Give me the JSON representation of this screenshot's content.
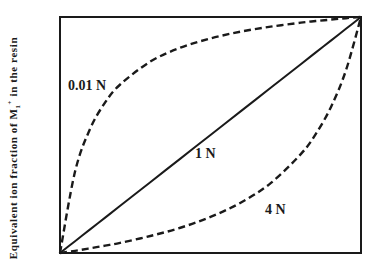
{
  "chart_data": {
    "type": "line",
    "title": "",
    "xlabel": "",
    "ylabel": "Equivalent ion fraction of M1+ in the resin",
    "ylabel_parts": {
      "prefix": "Equivalent ion fraction of M",
      "subscript": "1",
      "superscript": "+",
      "suffix": " in the resin"
    },
    "xlim": [
      0,
      1
    ],
    "ylim": [
      0,
      1
    ],
    "grid": false,
    "ticks": false,
    "legend": "inline labels",
    "x": [
      0,
      0.05,
      0.1,
      0.15,
      0.2,
      0.3,
      0.4,
      0.5,
      0.6,
      0.7,
      0.8,
      0.85,
      0.9,
      0.95,
      1.0
    ],
    "series": [
      {
        "name": "0.01 N",
        "style": "dashed",
        "values": [
          0,
          0.345,
          0.526,
          0.638,
          0.714,
          0.811,
          0.87,
          0.909,
          0.938,
          0.959,
          0.976,
          0.983,
          0.989,
          0.995,
          1.0
        ]
      },
      {
        "name": "1 N",
        "style": "solid",
        "values": [
          0,
          0.05,
          0.1,
          0.15,
          0.2,
          0.3,
          0.4,
          0.5,
          0.6,
          0.7,
          0.8,
          0.85,
          0.9,
          0.95,
          1.0
        ]
      },
      {
        "name": "4 N",
        "style": "dashed",
        "values": [
          0,
          0.009,
          0.02,
          0.031,
          0.043,
          0.072,
          0.107,
          0.153,
          0.213,
          0.296,
          0.419,
          0.505,
          0.618,
          0.774,
          1.0
        ]
      }
    ],
    "annotations": [
      {
        "text": "0.01 N",
        "series": "0.01 N"
      },
      {
        "text": "1 N",
        "series": "1 N"
      },
      {
        "text": "4 N",
        "series": "4 N"
      }
    ]
  },
  "labels": {
    "curve_001n": "0.01 N",
    "curve_1n": "1 N",
    "curve_4n": "4 N"
  },
  "colors": {
    "line": "#1a1a1a",
    "frame": "#1a1a1a",
    "background": "#ffffff"
  }
}
